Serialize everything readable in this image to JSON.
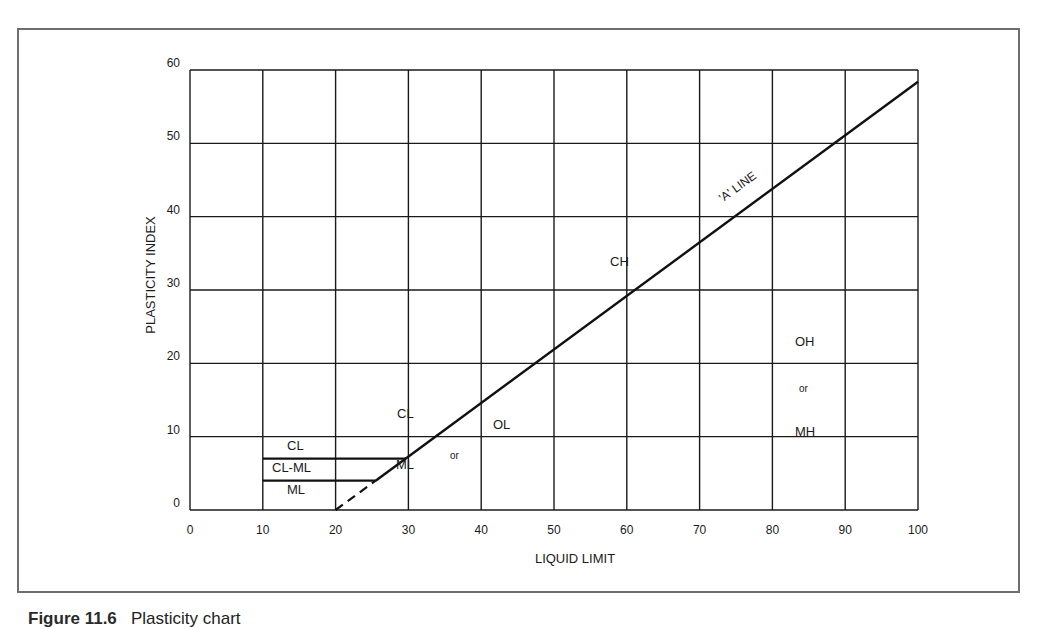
{
  "chart_data": {
    "type": "line",
    "title": "Plasticity chart",
    "xlabel": "LIQUID LIMIT",
    "ylabel": "PLASTICITY INDEX",
    "xlim": [
      0,
      100
    ],
    "ylim": [
      0,
      60
    ],
    "grid": true,
    "x_ticks": [
      0,
      10,
      20,
      30,
      40,
      50,
      60,
      70,
      80,
      90,
      100
    ],
    "y_ticks": [
      0,
      10,
      20,
      30,
      40,
      50,
      60
    ],
    "series": [
      {
        "name": "'A' LINE",
        "style": "solid",
        "x": [
          25.5,
          100
        ],
        "y": [
          4,
          58.4
        ],
        "equation": "PI = 0.73 (LL - 20)"
      },
      {
        "name": "A-line extension",
        "style": "dashed",
        "x": [
          20,
          25.5
        ],
        "y": [
          0,
          4
        ]
      },
      {
        "name": "PI = 7 boundary",
        "style": "solid",
        "x": [
          10,
          29.6
        ],
        "y": [
          7,
          7
        ]
      },
      {
        "name": "PI = 4 boundary",
        "style": "solid",
        "x": [
          10,
          25.5
        ],
        "y": [
          4,
          4
        ]
      }
    ],
    "annotations": [
      {
        "text": "'A' LINE",
        "x": 77,
        "y": 43,
        "rotation": -36
      },
      {
        "text": "CH",
        "x": 61,
        "y": 33
      },
      {
        "text": "CL",
        "x": 33,
        "y": 13
      },
      {
        "text": "OL",
        "x": 43,
        "y": 11
      },
      {
        "text": "ML",
        "x": 32,
        "y": 5
      },
      {
        "text": "or",
        "x": 36.5,
        "y": 7
      },
      {
        "text": "OH",
        "x": 85,
        "y": 23
      },
      {
        "text": "or",
        "x": 85,
        "y": 17
      },
      {
        "text": "MH",
        "x": 85,
        "y": 10.5
      },
      {
        "text": "CL",
        "x": 15,
        "y": 8.5
      },
      {
        "text": "CL-ML",
        "x": 15,
        "y": 5.7
      },
      {
        "text": "ML",
        "x": 15,
        "y": 3
      }
    ]
  },
  "axes": {
    "x_title": "LIQUID LIMIT",
    "y_title": "PLASTICITY INDEX",
    "x_tick_labels": [
      "0",
      "10",
      "20",
      "30",
      "40",
      "50",
      "60",
      "70",
      "80",
      "90",
      "100"
    ],
    "y_tick_labels": [
      "0",
      "10",
      "20",
      "30",
      "40",
      "50",
      "60"
    ]
  },
  "labels": {
    "a_line": "'A' LINE",
    "ch": "CH",
    "cl": "CL",
    "ol": "OL",
    "ml": "ML",
    "or1": "or",
    "oh": "OH",
    "or2": "or",
    "mh": "MH",
    "cl_small": "CL",
    "clml_small": "CL-ML",
    "ml_small": "ML"
  },
  "caption": {
    "figure": "Figure 11.6",
    "text": "Plasticity chart"
  }
}
